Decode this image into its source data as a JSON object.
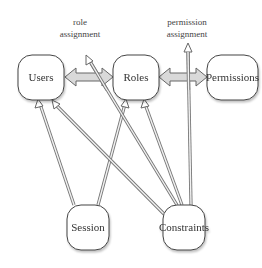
{
  "diagram": {
    "type": "RBAC model",
    "nodes": [
      {
        "id": "users",
        "label": "Users"
      },
      {
        "id": "roles",
        "label": "Roles"
      },
      {
        "id": "permissions",
        "label": "Permissions"
      },
      {
        "id": "session",
        "label": "Session"
      },
      {
        "id": "constraints",
        "label": "Constraints"
      }
    ],
    "edge_labels": {
      "role_assignment_line1": "role",
      "role_assignment_line2": "assignment",
      "permission_assignment_line1": "permission",
      "permission_assignment_line2": "assignment"
    },
    "edges": [
      {
        "from": "users",
        "to": "roles",
        "style": "bidirectional-fat",
        "label": "role assignment"
      },
      {
        "from": "roles",
        "to": "permissions",
        "style": "bidirectional-fat",
        "label": "permission assignment"
      },
      {
        "from": "session",
        "to": "users",
        "style": "thin-arrow"
      },
      {
        "from": "session",
        "to": "roles",
        "style": "thin-arrow"
      },
      {
        "from": "constraints",
        "to": "users",
        "style": "thin-arrow"
      },
      {
        "from": "constraints",
        "to": "roles",
        "style": "thin-arrow"
      },
      {
        "from": "constraints",
        "to": "role assignment",
        "style": "thin-arrow"
      },
      {
        "from": "constraints",
        "to": "permission assignment",
        "style": "thin-arrow"
      }
    ],
    "colors": {
      "stroke": "#555555",
      "fat_arrow_fill": "#d9d9d9",
      "thin_arrow_fill": "#e6e6e6"
    }
  }
}
